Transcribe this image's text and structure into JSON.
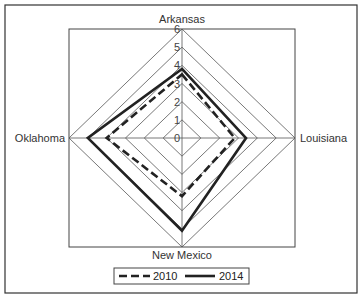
{
  "chart_data": {
    "type": "radar",
    "title": "",
    "axes": [
      "Arkansas",
      "Louisiana",
      "New Mexico",
      "Oklahoma"
    ],
    "rlim": [
      0,
      6
    ],
    "ticks": [
      "0",
      "1",
      "2",
      "3",
      "4",
      "5",
      "6"
    ],
    "grid": true,
    "legend_position": "bottom",
    "series": [
      {
        "name": "2010",
        "style": "dashed",
        "values": [
          3.5,
          2.8,
          3.2,
          4.0
        ]
      },
      {
        "name": "2014",
        "style": "solid",
        "values": [
          3.8,
          3.4,
          5.1,
          5.0
        ]
      }
    ]
  },
  "colors": {
    "grid": "#555555",
    "series_line": "#222222",
    "frame": "#333333"
  }
}
